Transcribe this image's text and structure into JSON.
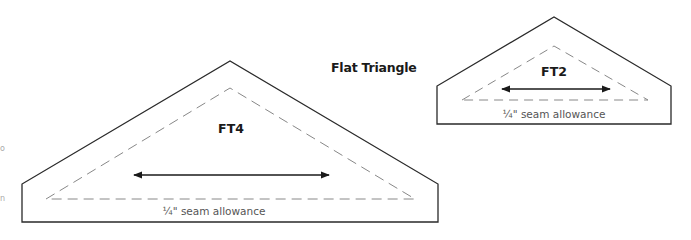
{
  "title": "Flat Triangle",
  "colors": {
    "outline": "#2a2a2a",
    "dash": "#888888",
    "text": "#1a1a1a",
    "seam_text": "#555555"
  },
  "pieces": [
    {
      "name": "FT4",
      "seam_label": "¼\" seam allowance",
      "grain_arrow": "double-headed"
    },
    {
      "name": "FT2",
      "seam_label": "¼\" seam allowance",
      "grain_arrow": "double-headed"
    }
  ],
  "edge_fragments": [
    "o",
    "n"
  ]
}
